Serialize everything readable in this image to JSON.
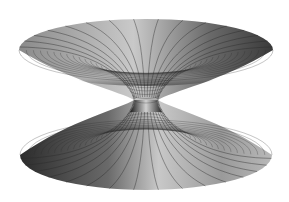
{
  "image": {
    "subject": "wormhole-surface",
    "description": "Grayscale 3D mesh rendering of a wormhole / Flamm's paraboloid-like surface: two flaring discs joined by a narrow throat",
    "background": "#ffffff",
    "colors": {
      "surface_light": "#d8d8d8",
      "surface_mid": "#9a9a9a",
      "surface_dark": "#3a3a3a",
      "throat_dark": "#0d0d0d",
      "grid_line": "#2a2a2a"
    },
    "geometry": {
      "top_disc": {
        "cx": 146,
        "cy": 50,
        "rx": 127,
        "ry": 31
      },
      "bottom_disc": {
        "cx": 146,
        "cy": 155,
        "rx": 126,
        "ry": 35
      },
      "throat": {
        "cx": 146,
        "cy": 100,
        "half_width": 12
      }
    },
    "mesh": {
      "radial_lines": 16,
      "rings": 22
    }
  }
}
